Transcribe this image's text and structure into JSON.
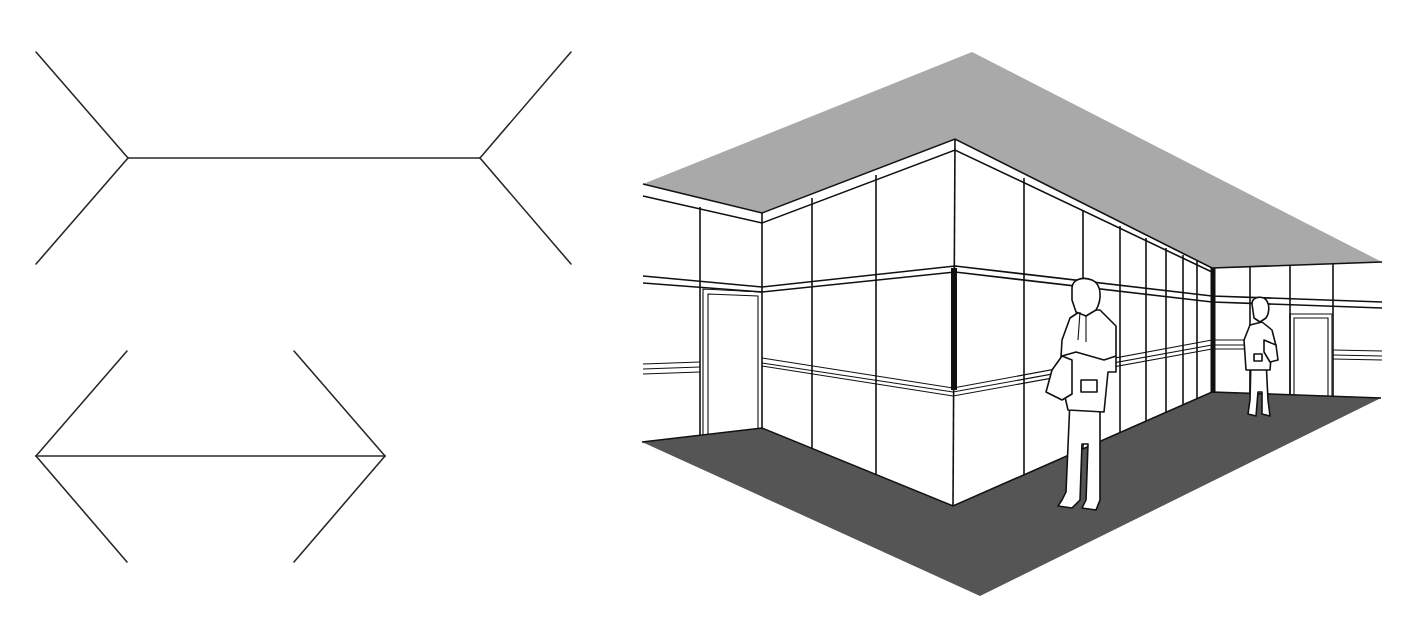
{
  "figure": {
    "panels": [
      {
        "id": "fins-out",
        "description": "Horizontal line with outward-pointing fins (appears longer)",
        "shaft": {
          "x1": 128,
          "x2": 480,
          "y": 158
        }
      },
      {
        "id": "fins-in",
        "description": "Horizontal line with inward-pointing arrowheads (appears shorter)",
        "shaft": {
          "x1": 36,
          "x2": 385,
          "y": 456
        }
      },
      {
        "id": "room-scene",
        "description": "Perspective room: inside corner (far) vs outside corner (near), two standing men"
      }
    ],
    "colors": {
      "line": "#2a2a2a",
      "ceiling": "#a9a9a9",
      "floor": "#555555",
      "wall": "#ffffff",
      "background": "#ffffff"
    }
  }
}
